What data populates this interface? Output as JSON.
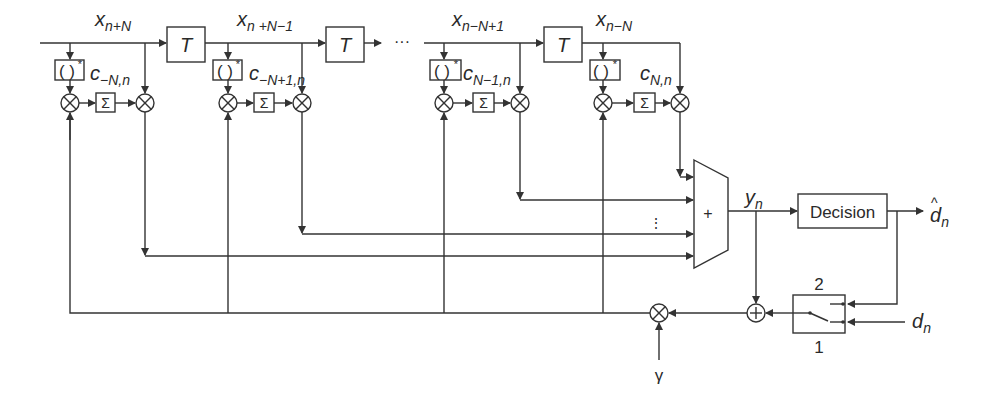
{
  "figure": {
    "type": "block-diagram"
  },
  "delay_line": {
    "delay_label": "T",
    "ellipsis": "···",
    "signals": [
      {
        "base": "x",
        "sub": "n+N"
      },
      {
        "base": "x",
        "sub": "n +N−1"
      },
      {
        "base": "x",
        "sub": "n−N+1"
      },
      {
        "base": "x",
        "sub": "n−N"
      }
    ]
  },
  "taps": [
    {
      "coef_base": "c",
      "coef_sub": "−N,n",
      "conj_label": "( )",
      "conj_sup": "*",
      "sum_label": "Σ",
      "mult_symbol": "⊗"
    },
    {
      "coef_base": "c",
      "coef_sub": "−N+1,n",
      "conj_label": "( )",
      "conj_sup": "*",
      "sum_label": "Σ",
      "mult_symbol": "⊗"
    },
    {
      "coef_base": "c",
      "coef_sub": "N−1,n",
      "conj_label": "( )",
      "conj_sup": "*",
      "sum_label": "Σ",
      "mult_symbol": "⊗"
    },
    {
      "coef_base": "c",
      "coef_sub": "N,n",
      "conj_label": "( )",
      "conj_sup": "*",
      "sum_label": "Σ",
      "mult_symbol": "⊗"
    }
  ],
  "adder": {
    "label": "+",
    "input_ellipsis": "⋮"
  },
  "output": {
    "base": "y",
    "sub": "n"
  },
  "decision": {
    "label": "Decision",
    "output_base": "d",
    "output_hat": "^",
    "output_sub": "n"
  },
  "switch": {
    "position_top": "2",
    "position_bottom": "1",
    "training_base": "d",
    "training_sub": "n"
  },
  "error_summer": {
    "label": "+"
  },
  "step_size": {
    "label": "γ"
  }
}
